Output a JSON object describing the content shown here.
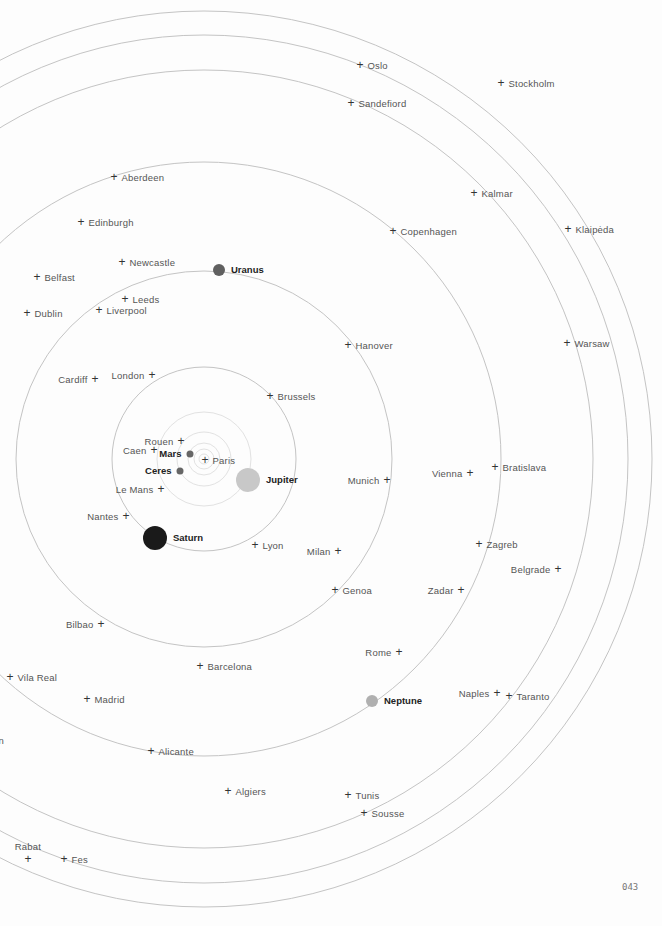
{
  "page": {
    "number": "043"
  },
  "map": {
    "center": {
      "x": 204,
      "y": 459
    },
    "rings": [
      {
        "r": 5,
        "style": "inner"
      },
      {
        "r": 10,
        "style": "inner"
      },
      {
        "r": 16,
        "style": "inner"
      },
      {
        "r": 27,
        "style": "inner"
      },
      {
        "r": 47,
        "style": "inner"
      },
      {
        "r": 92,
        "style": "main"
      },
      {
        "r": 188,
        "style": "main"
      },
      {
        "r": 297,
        "style": "main"
      },
      {
        "r": 389,
        "style": "main"
      },
      {
        "r": 424,
        "style": "main"
      },
      {
        "r": 448,
        "style": "main"
      }
    ],
    "colors": {
      "ring": "#c4c4c4",
      "text": "#555555",
      "planet_label": "#222222"
    }
  },
  "planets": [
    {
      "name": "Mars",
      "x": 190,
      "y": 454,
      "r": 3.5,
      "color": "#666666",
      "label_side": "left"
    },
    {
      "name": "Ceres",
      "x": 180,
      "y": 471,
      "r": 3.5,
      "color": "#666666",
      "label_side": "left"
    },
    {
      "name": "Jupiter",
      "x": 248,
      "y": 480,
      "r": 12,
      "color": "#c8c8c8",
      "label_side": "right"
    },
    {
      "name": "Saturn",
      "x": 155,
      "y": 538,
      "r": 12,
      "color": "#1a1a1a",
      "label_side": "right"
    },
    {
      "name": "Uranus",
      "x": 219,
      "y": 270,
      "r": 6,
      "color": "#606060",
      "label_side": "right"
    },
    {
      "name": "Neptune",
      "x": 372,
      "y": 701,
      "r": 6,
      "color": "#b0b0b0",
      "label_side": "right"
    }
  ],
  "cities": [
    {
      "name": "Oslo",
      "x": 360,
      "y": 65,
      "side": "right"
    },
    {
      "name": "Stockholm",
      "x": 501,
      "y": 83,
      "side": "right"
    },
    {
      "name": "Sandefiord",
      "x": 351,
      "y": 103,
      "side": "right"
    },
    {
      "name": "Aberdeen",
      "x": 114,
      "y": 177,
      "side": "right"
    },
    {
      "name": "Kalmar",
      "x": 474,
      "y": 193,
      "side": "right"
    },
    {
      "name": "Edinburgh",
      "x": 81,
      "y": 222,
      "side": "right"
    },
    {
      "name": "Klaipėda",
      "x": 568,
      "y": 229,
      "side": "right"
    },
    {
      "name": "Copenhagen",
      "x": 393,
      "y": 231,
      "side": "right"
    },
    {
      "name": "Newcastle",
      "x": 122,
      "y": 262,
      "side": "right"
    },
    {
      "name": "Belfast",
      "x": 37,
      "y": 277,
      "side": "right"
    },
    {
      "name": "Leeds",
      "x": 125,
      "y": 299,
      "side": "right"
    },
    {
      "name": "Liverpool",
      "x": 99,
      "y": 310,
      "side": "right"
    },
    {
      "name": "Dublin",
      "x": 27,
      "y": 313,
      "side": "right"
    },
    {
      "name": "Warsaw",
      "x": 567,
      "y": 343,
      "side": "right"
    },
    {
      "name": "Hanover",
      "x": 348,
      "y": 345,
      "side": "right"
    },
    {
      "name": "London",
      "x": 152,
      "y": 375,
      "side": "left"
    },
    {
      "name": "Cardiff",
      "x": 95,
      "y": 379,
      "side": "left"
    },
    {
      "name": "Brussels",
      "x": 270,
      "y": 396,
      "side": "right"
    },
    {
      "name": "Rouen",
      "x": 181,
      "y": 441,
      "side": "left"
    },
    {
      "name": "Caen",
      "x": 154,
      "y": 450,
      "side": "left"
    },
    {
      "name": "Paris",
      "x": 205,
      "y": 460,
      "side": "right"
    },
    {
      "name": "Bratislava",
      "x": 495,
      "y": 467,
      "side": "right"
    },
    {
      "name": "Vienna",
      "x": 470,
      "y": 473,
      "side": "left"
    },
    {
      "name": "Munich",
      "x": 387,
      "y": 480,
      "side": "left"
    },
    {
      "name": "Le Mans",
      "x": 161,
      "y": 489,
      "side": "left"
    },
    {
      "name": "Nantes",
      "x": 126,
      "y": 516,
      "side": "left"
    },
    {
      "name": "Zagreb",
      "x": 479,
      "y": 544,
      "side": "right"
    },
    {
      "name": "Lyon",
      "x": 255,
      "y": 545,
      "side": "right"
    },
    {
      "name": "Milan",
      "x": 338,
      "y": 551,
      "side": "left"
    },
    {
      "name": "Belgrade",
      "x": 558,
      "y": 569,
      "side": "left"
    },
    {
      "name": "Genoa",
      "x": 335,
      "y": 590,
      "side": "right"
    },
    {
      "name": "Zadar",
      "x": 461,
      "y": 590,
      "side": "left"
    },
    {
      "name": "Bilbao",
      "x": 101,
      "y": 624,
      "side": "left"
    },
    {
      "name": "Rome",
      "x": 399,
      "y": 652,
      "side": "left"
    },
    {
      "name": "Barcelona",
      "x": 200,
      "y": 666,
      "side": "right"
    },
    {
      "name": "Vila Real",
      "x": 10,
      "y": 677,
      "side": "right"
    },
    {
      "name": "Naples",
      "x": 497,
      "y": 693,
      "side": "left"
    },
    {
      "name": "Taranto",
      "x": 509,
      "y": 696,
      "side": "right"
    },
    {
      "name": "Madrid",
      "x": 87,
      "y": 699,
      "side": "right"
    },
    {
      "name": "Lisbon",
      "x": -20,
      "y": 740,
      "side": "right",
      "display": "bon"
    },
    {
      "name": "Alicante",
      "x": 151,
      "y": 751,
      "side": "right"
    },
    {
      "name": "Algiers",
      "x": 228,
      "y": 791,
      "side": "right"
    },
    {
      "name": "Tunis",
      "x": 348,
      "y": 795,
      "side": "right"
    },
    {
      "name": "Sousse",
      "x": 364,
      "y": 813,
      "side": "right"
    },
    {
      "name": "Rabat",
      "x": 28,
      "y": 859,
      "side": "above"
    },
    {
      "name": "Fes",
      "x": 64,
      "y": 859,
      "side": "right"
    }
  ]
}
